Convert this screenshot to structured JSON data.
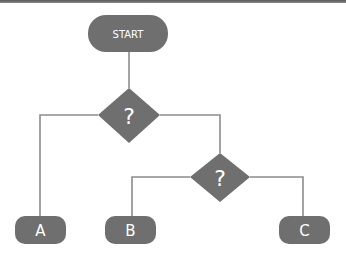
{
  "diagram": {
    "type": "flowchart",
    "colors": {
      "node_fill": "#6f6f6f",
      "connector": "#8c8c8c",
      "text": "#ffffff",
      "top_border": "#5a5a5a"
    },
    "nodes": {
      "start": {
        "label": "START",
        "shape": "terminator"
      },
      "decision1": {
        "label": "?",
        "shape": "decision"
      },
      "decision2": {
        "label": "?",
        "shape": "decision"
      },
      "a": {
        "label": "A",
        "shape": "terminator"
      },
      "b": {
        "label": "B",
        "shape": "terminator"
      },
      "c": {
        "label": "C",
        "shape": "terminator"
      }
    },
    "edges": [
      {
        "from": "start",
        "to": "decision1"
      },
      {
        "from": "decision1",
        "to": "a"
      },
      {
        "from": "decision1",
        "to": "decision2"
      },
      {
        "from": "decision2",
        "to": "b"
      },
      {
        "from": "decision2",
        "to": "c"
      }
    ]
  }
}
